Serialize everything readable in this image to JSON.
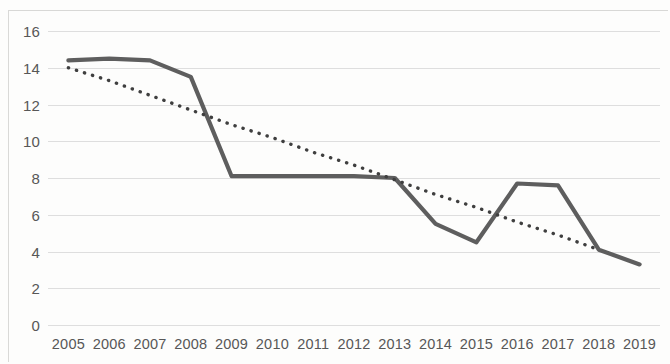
{
  "chart_data": {
    "type": "line",
    "title": "",
    "xlabel": "",
    "ylabel": "",
    "categories": [
      "2005",
      "2006",
      "2007",
      "2008",
      "2009",
      "2010",
      "2011",
      "2012",
      "2013",
      "2014",
      "2015",
      "2016",
      "2017",
      "2018",
      "2019"
    ],
    "ylim": [
      0,
      16
    ],
    "y_ticks": [
      0,
      2,
      4,
      6,
      8,
      10,
      12,
      14,
      16
    ],
    "grid": "horizontal",
    "legend": "none",
    "series": [
      {
        "name": "data",
        "style": "solid",
        "color": "#5e5e5e",
        "values": [
          14.4,
          14.5,
          14.4,
          13.5,
          8.1,
          8.1,
          8.1,
          8.1,
          8.0,
          5.5,
          4.5,
          7.7,
          7.6,
          4.1,
          3.3
        ]
      },
      {
        "name": "trendline",
        "style": "dotted",
        "color": "#3f3f3f",
        "values": [
          14.0,
          13.3,
          12.5,
          11.7,
          10.9,
          10.2,
          9.4,
          8.7,
          7.9,
          7.1,
          6.4,
          5.6,
          4.9,
          4.1,
          null
        ]
      }
    ]
  }
}
